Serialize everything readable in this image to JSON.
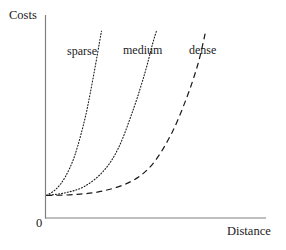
{
  "chart_data": {
    "type": "line",
    "title": "",
    "subtitle": "",
    "xlabel": "Distance",
    "ylabel": "Costs",
    "origin_label": "0",
    "grid": false,
    "legend_position": "inline-labels",
    "axis_color": "#808080",
    "curve_color": "#1a1a1a",
    "background": "#ffffff",
    "xlim": [
      0,
      10
    ],
    "ylim": [
      0,
      10
    ],
    "x_tick_labels": [],
    "y_tick_labels": [],
    "annotations": [
      {
        "text": "sparse",
        "x": 1.7,
        "y": 8.5
      },
      {
        "text": "medium",
        "x": 4.1,
        "y": 8.6
      },
      {
        "text": "dense",
        "x": 7.0,
        "y": 8.6
      }
    ],
    "series": [
      {
        "name": "sparse",
        "label": "sparse",
        "style": "dotted",
        "dash_pattern": "1 2",
        "line_width": 1.1,
        "x": [
          0.0,
          0.5,
          1.0,
          1.5,
          2.0,
          2.3,
          2.6,
          2.8,
          2.9
        ],
        "y": [
          0.45,
          0.8,
          1.5,
          2.7,
          4.6,
          6.1,
          7.8,
          9.0,
          9.6
        ]
      },
      {
        "name": "medium",
        "label": "medium",
        "style": "dotted",
        "dash_pattern": "1 2",
        "line_width": 1.1,
        "x": [
          0.0,
          1.0,
          2.0,
          3.0,
          3.8,
          4.6,
          5.2,
          5.6,
          5.8
        ],
        "y": [
          0.45,
          0.6,
          0.95,
          1.8,
          3.1,
          5.3,
          7.3,
          8.9,
          9.6
        ]
      },
      {
        "name": "dense",
        "label": "dense",
        "style": "dashed",
        "dash_pattern": "6 4",
        "line_width": 1.2,
        "x": [
          0.0,
          1.5,
          3.0,
          4.5,
          5.6,
          6.6,
          7.4,
          8.0,
          8.4
        ],
        "y": [
          0.45,
          0.5,
          0.7,
          1.25,
          2.2,
          3.9,
          5.9,
          7.8,
          9.6
        ]
      }
    ]
  }
}
